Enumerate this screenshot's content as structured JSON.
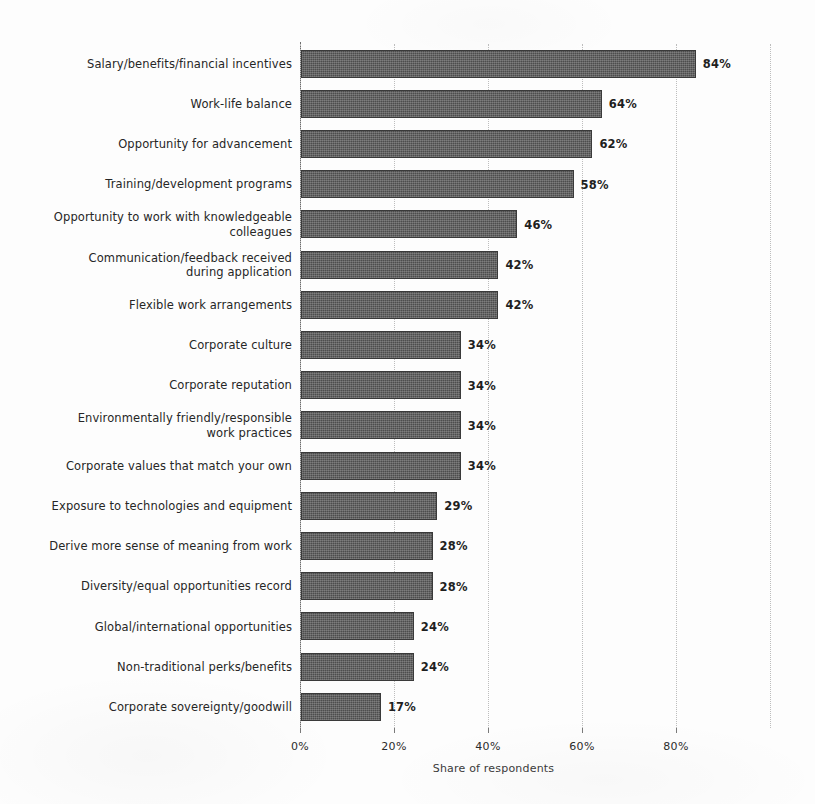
{
  "chart_data": {
    "type": "bar",
    "orientation": "horizontal",
    "title": "",
    "subtitle": "",
    "xlabel": "Share of respondents",
    "ylabel": "",
    "xlim": [
      0,
      100
    ],
    "xticks": [
      0,
      20,
      40,
      60,
      80
    ],
    "xtick_labels": [
      "0%",
      "20%",
      "40%",
      "60%",
      "80%"
    ],
    "grid": true,
    "grid_axis": "x",
    "legend": null,
    "bar_color": "#4d4d4d",
    "background_color": "#fdfdfd",
    "value_suffix": "%",
    "categories": [
      "Salary/benefits/financial incentives",
      "Work-life balance",
      "Opportunity for advancement",
      "Training/development programs",
      "Opportunity to work with knowledgeable colleagues",
      "Communication/feedback received during application",
      "Flexible work arrangements",
      "Corporate culture",
      "Corporate reputation",
      "Environmentally friendly/responsible work practices",
      "Corporate values that match your own",
      "Exposure to technologies and equipment",
      "Derive more sense of meaning from work",
      "Diversity/equal opportunities record",
      "Global/international opportunities",
      "Non-traditional perks/benefits",
      "Corporate sovereignty/goodwill"
    ],
    "values": [
      84,
      64,
      62,
      58,
      46,
      42,
      42,
      34,
      34,
      34,
      34,
      29,
      28,
      28,
      24,
      24,
      17
    ],
    "value_labels": [
      "84%",
      "64%",
      "62%",
      "58%",
      "46%",
      "42%",
      "42%",
      "34%",
      "34%",
      "34%",
      "34%",
      "29%",
      "28%",
      "28%",
      "24%",
      "24%",
      "17%"
    ]
  },
  "rows": [
    {
      "label_lines": [
        "Salary/benefits/financial incentives"
      ],
      "value": 84,
      "value_label": "84%"
    },
    {
      "label_lines": [
        "Work-life balance"
      ],
      "value": 64,
      "value_label": "64%"
    },
    {
      "label_lines": [
        "Opportunity for advancement"
      ],
      "value": 62,
      "value_label": "62%"
    },
    {
      "label_lines": [
        "Training/development programs"
      ],
      "value": 58,
      "value_label": "58%"
    },
    {
      "label_lines": [
        "Opportunity to work with knowledgeable",
        "colleagues"
      ],
      "value": 46,
      "value_label": "46%"
    },
    {
      "label_lines": [
        "Communication/feedback received",
        "during application"
      ],
      "value": 42,
      "value_label": "42%"
    },
    {
      "label_lines": [
        "Flexible work arrangements"
      ],
      "value": 42,
      "value_label": "42%"
    },
    {
      "label_lines": [
        "Corporate culture"
      ],
      "value": 34,
      "value_label": "34%"
    },
    {
      "label_lines": [
        "Corporate reputation"
      ],
      "value": 34,
      "value_label": "34%"
    },
    {
      "label_lines": [
        "Environmentally friendly/responsible",
        "work practices"
      ],
      "value": 34,
      "value_label": "34%"
    },
    {
      "label_lines": [
        "Corporate values that match your own"
      ],
      "value": 34,
      "value_label": "34%"
    },
    {
      "label_lines": [
        "Exposure to technologies and equipment"
      ],
      "value": 29,
      "value_label": "29%"
    },
    {
      "label_lines": [
        "Derive more sense of meaning from work"
      ],
      "value": 28,
      "value_label": "28%"
    },
    {
      "label_lines": [
        "Diversity/equal opportunities record"
      ],
      "value": 28,
      "value_label": "28%"
    },
    {
      "label_lines": [
        "Global/international opportunities"
      ],
      "value": 24,
      "value_label": "24%"
    },
    {
      "label_lines": [
        "Non-traditional perks/benefits"
      ],
      "value": 24,
      "value_label": "24%"
    },
    {
      "label_lines": [
        "Corporate sovereignty/goodwill"
      ],
      "value": 17,
      "value_label": "17%"
    }
  ],
  "axis": {
    "x_title": "Share of respondents",
    "ticks": [
      {
        "value": 0,
        "label": "0%"
      },
      {
        "value": 20,
        "label": "20%"
      },
      {
        "value": 40,
        "label": "40%"
      },
      {
        "value": 60,
        "label": "60%"
      },
      {
        "value": 80,
        "label": "80%"
      }
    ],
    "gridline_values": [
      0,
      20,
      40,
      60,
      80,
      100
    ]
  }
}
